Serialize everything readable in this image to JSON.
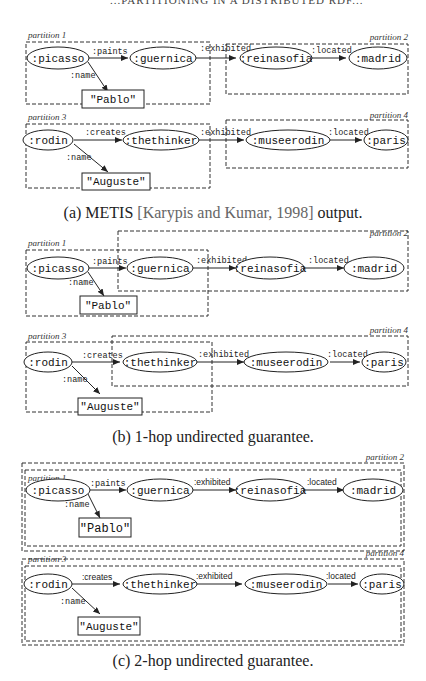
{
  "page_header": "...PARTITIONING IN A DISTRIBUTED RDF...",
  "nodes": {
    "picasso": ":picasso",
    "guernica": ":guernica",
    "reinasofia": ":reinasofia",
    "madrid": ":madrid",
    "pablo": "\"Pablo\"",
    "rodin": ":rodin",
    "thethinker": ":thethinker",
    "museerodin": ":museerodin",
    "paris": ":paris",
    "auguste": "\"Auguste\""
  },
  "edges": {
    "paints": ":paints",
    "name": ":name",
    "exhibited": ":exhibited",
    "located": ":located",
    "creates": ":creates"
  },
  "partitions": {
    "p1": "partition 1",
    "p2": "partition 2",
    "p3": "partition 3",
    "p4": "partition 4"
  },
  "captions": {
    "a_prefix": "(a) METIS ",
    "a_cite": "[Karypis and Kumar, 1998]",
    "a_suffix": " output.",
    "b": "(b) 1-hop undirected guarantee.",
    "c": "(c) 2-hop undirected guarantee."
  }
}
